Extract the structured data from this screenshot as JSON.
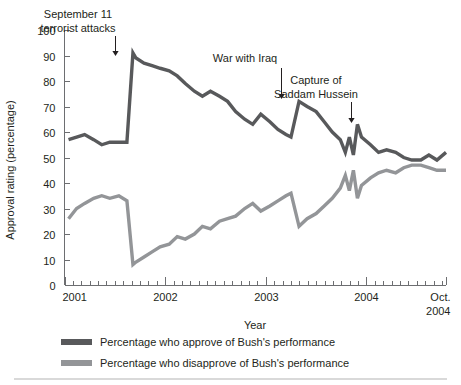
{
  "chart_data": {
    "type": "line",
    "title": "",
    "xlabel": "Year",
    "ylabel": "Approval rating (percentage)",
    "ylim": [
      0,
      100
    ],
    "ytick_values": [
      0,
      10,
      20,
      30,
      40,
      50,
      60,
      70,
      80,
      90,
      100
    ],
    "ytick_labels": [
      "0",
      "10",
      "20",
      "30",
      "40",
      "50",
      "60",
      "70",
      "80",
      "90",
      "100"
    ],
    "xlim": [
      2001.0,
      2004.79
    ],
    "xtick_labels": [
      "2001",
      "2002",
      "2003",
      "2004",
      "Oct. 2004"
    ],
    "xtick_values": [
      2001.0,
      2002.0,
      2003.0,
      2004.0,
      2004.79
    ],
    "xtick_last_line1": "Oct.",
    "xtick_last_line2": "2004",
    "grid": false,
    "legend_position": "below",
    "minor_ticks_per_year": 12,
    "series": [
      {
        "name": "Percentage who approve of Bush's performance",
        "color": "#58595b",
        "x": [
          2001.04,
          2001.12,
          2001.2,
          2001.29,
          2001.37,
          2001.45,
          2001.54,
          2001.62,
          2001.68,
          2001.71,
          2001.79,
          2001.87,
          2001.95,
          2002.04,
          2002.12,
          2002.2,
          2002.29,
          2002.37,
          2002.45,
          2002.54,
          2002.62,
          2002.7,
          2002.79,
          2002.87,
          2002.95,
          2003.04,
          2003.12,
          2003.2,
          2003.25,
          2003.33,
          2003.41,
          2003.5,
          2003.58,
          2003.66,
          2003.74,
          2003.79,
          2003.83,
          2003.87,
          2003.91,
          2003.95,
          2004.04,
          2004.12,
          2004.2,
          2004.29,
          2004.37,
          2004.45,
          2004.54,
          2004.62,
          2004.7,
          2004.79
        ],
        "y": [
          57,
          58,
          59,
          57,
          55,
          56,
          56,
          56,
          91,
          89,
          87,
          86,
          85,
          84,
          82,
          79,
          76,
          74,
          76,
          74,
          72,
          68,
          65,
          63,
          67,
          64,
          61,
          59,
          58,
          72,
          70,
          68,
          64,
          60,
          57,
          52,
          58,
          51,
          63,
          58,
          55,
          52,
          53,
          52,
          50,
          49,
          49,
          51,
          49,
          52
        ]
      },
      {
        "name": "Percentage who disapprove of Bush's performance",
        "color": "#939598",
        "x": [
          2001.04,
          2001.12,
          2001.2,
          2001.29,
          2001.37,
          2001.45,
          2001.54,
          2001.62,
          2001.68,
          2001.71,
          2001.79,
          2001.87,
          2001.95,
          2002.04,
          2002.12,
          2002.2,
          2002.29,
          2002.37,
          2002.45,
          2002.54,
          2002.62,
          2002.7,
          2002.79,
          2002.87,
          2002.95,
          2003.04,
          2003.12,
          2003.2,
          2003.25,
          2003.33,
          2003.41,
          2003.5,
          2003.58,
          2003.66,
          2003.74,
          2003.79,
          2003.83,
          2003.87,
          2003.91,
          2003.95,
          2004.04,
          2004.12,
          2004.2,
          2004.29,
          2004.37,
          2004.45,
          2004.54,
          2004.62,
          2004.7,
          2004.79
        ],
        "y": [
          26,
          30,
          32,
          34,
          35,
          34,
          35,
          33,
          8,
          9,
          11,
          13,
          15,
          16,
          19,
          18,
          20,
          23,
          22,
          25,
          26,
          27,
          30,
          32,
          29,
          31,
          33,
          35,
          36,
          23,
          26,
          28,
          31,
          34,
          38,
          43,
          37,
          45,
          34,
          39,
          42,
          44,
          45,
          44,
          46,
          47,
          47,
          46,
          45,
          45
        ]
      }
    ],
    "annotations": [
      {
        "name": "september-11",
        "lines": [
          "September 11",
          "terrorist attacks"
        ],
        "text_x": 78,
        "text_y": 18,
        "arrow_x": 115,
        "arrow_y_start": 36,
        "arrow_y_end": 56
      },
      {
        "name": "war-with-iraq",
        "lines": [
          "War with Iraq"
        ],
        "text_x": 245,
        "text_y": 62,
        "arrow_x": 281,
        "arrow_y_start": 68,
        "arrow_y_end": 99
      },
      {
        "name": "capture-of-saddam-hussein",
        "lines": [
          "Capture of",
          "Saddam Hussein"
        ],
        "text_x": 316,
        "text_y": 84,
        "arrow_x": 351,
        "arrow_y_start": 102,
        "arrow_y_end": 123
      }
    ]
  },
  "legend": {
    "items": [
      {
        "label": "Percentage who approve of Bush's performance",
        "color": "#58595b"
      },
      {
        "label": "Percentage who disapprove of Bush's performance",
        "color": "#939598"
      }
    ]
  },
  "colors": {
    "approve": "#58595b",
    "disapprove": "#939598",
    "axis": "#6d6e71",
    "text": "#231f20",
    "rule": "#d9d9d9",
    "background": "#ffffff"
  }
}
